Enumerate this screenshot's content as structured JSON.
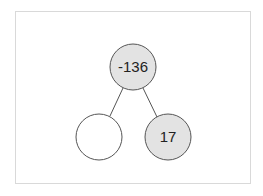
{
  "tree": {
    "edge_color": "#555555",
    "nodes": [
      {
        "id": "root",
        "value": "-136",
        "cx": 133,
        "cy": 67,
        "r": 23,
        "fill": "#e3e3e3"
      },
      {
        "id": "left",
        "value": "",
        "cx": 99,
        "cy": 137,
        "r": 23,
        "fill": "#ffffff"
      },
      {
        "id": "right",
        "value": "17",
        "cx": 168,
        "cy": 137,
        "r": 23,
        "fill": "#e3e3e3"
      }
    ],
    "edges": [
      {
        "from": "root",
        "to": "left"
      },
      {
        "from": "root",
        "to": "right"
      }
    ]
  }
}
